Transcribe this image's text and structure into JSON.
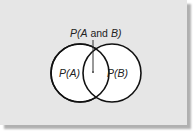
{
  "diagram": {
    "type": "venn",
    "title_label": {
      "prefix": "P(A",
      "conj": " and ",
      "suffix": "B)"
    },
    "circles": [
      {
        "id": "A",
        "label": "P(A)",
        "cx": 80,
        "cy": 73,
        "r": 29
      },
      {
        "id": "B",
        "label": "P(B)",
        "cx": 112,
        "cy": 73,
        "r": 29
      }
    ],
    "intersection_label": "P(A and B)",
    "colors": {
      "background": "#e6e6e6",
      "stroke": "#111111",
      "fill": "#ffffff",
      "shadow": "#b0b0b0"
    }
  }
}
